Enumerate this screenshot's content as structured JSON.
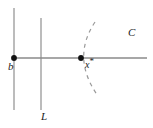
{
  "figure": {
    "width": 153,
    "height": 128,
    "background_color": "#ffffff",
    "stroke_color": "#808080",
    "curve_color": "#8a8a8a",
    "point_color": "#000000",
    "label_color": "#1a1a1a"
  },
  "labels": {
    "b": "b",
    "x_star_base": "x",
    "x_star_superscript": "*",
    "L": "L",
    "C": "C"
  },
  "geometry": {
    "horizontal_line": {
      "x1": 14,
      "y1": 58,
      "x2": 147,
      "y2": 58
    },
    "vertical_line_left": {
      "x1": 14,
      "y1": 8,
      "x2": 14,
      "y2": 110
    },
    "vertical_line_L": {
      "x1": 41,
      "y1": 18,
      "x2": 41,
      "y2": 110
    },
    "point_b": {
      "cx": 14,
      "cy": 58,
      "r": 2.8
    },
    "point_x_star": {
      "cx": 81,
      "cy": 58,
      "r": 2.8
    },
    "dashed_curve": {
      "start": {
        "x": 95,
        "y": 22
      },
      "control": {
        "x": 72,
        "y": 58
      },
      "end": {
        "x": 98,
        "y": 96
      },
      "dash_pattern": "4 4"
    }
  }
}
